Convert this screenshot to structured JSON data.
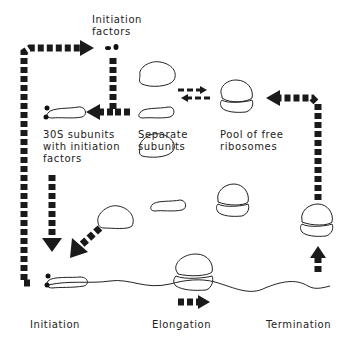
{
  "diagram": {
    "labels": {
      "initiation_factors": "Initiation\nfactors",
      "subunits_with_factors": "30S subunits\nwith initiation\nfactors",
      "separate_subunits": "Separate\nsubunits",
      "pool_free_ribosomes": "Pool of free\nribosomes",
      "initiation": "Initiation",
      "elongation": "Elongation",
      "termination": "Termination"
    },
    "colors": {
      "arrow": "#1a1a1a",
      "outline": "#222222",
      "background": "#ffffff"
    }
  }
}
